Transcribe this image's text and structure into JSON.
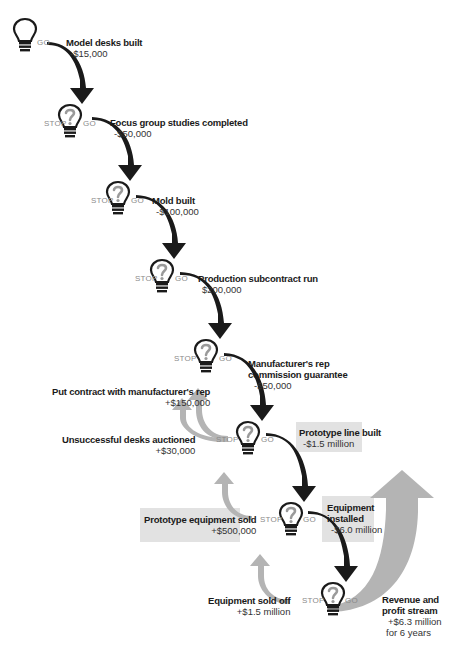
{
  "diagram": {
    "type": "decision-flow",
    "stop_label": "STOP",
    "go_label": "GO",
    "colors": {
      "go_arrow": "#1a1a1a",
      "stop_arrow": "#b4b4b4",
      "highlight_box": "#e2e2e2",
      "stop_go_text": "#8a8a8a",
      "revenue_arrow": "#b0b0b0"
    },
    "go_steps": [
      {
        "title": "Model desks built",
        "value": "-$15,000"
      },
      {
        "title": "Focus group studies completed",
        "value": "-$50,000"
      },
      {
        "title": "Mold built",
        "value": "-$100,000"
      },
      {
        "title": "Production subcontract run",
        "value": "$200,000"
      },
      {
        "title_line1": "Manufacturer's rep",
        "title_line2": "commission guarantee",
        "value": "-$50,000"
      },
      {
        "title": "Prototype line built",
        "value": "-$1.5 million",
        "highlighted": true
      },
      {
        "title_line1": "Equipment",
        "title_line2": "installed",
        "value": "-$6.0 million",
        "highlighted": true
      }
    ],
    "stop_outcomes": [
      {
        "title": "Put contract with manufacturer's rep",
        "value": "+$150,000"
      },
      {
        "title": "Unsuccessful desks auctioned",
        "value": "+$30,000"
      },
      {
        "title": "Prototype equipment sold",
        "value": "+$500,000",
        "highlighted": true
      },
      {
        "title": "Equipment sold off",
        "value": "+$1.5 million"
      }
    ],
    "final_outcome": {
      "title_line1": "Revenue and",
      "title_line2": "profit stream",
      "value_line1": "+$6.3 million",
      "value_line2": "for 6 years"
    }
  }
}
